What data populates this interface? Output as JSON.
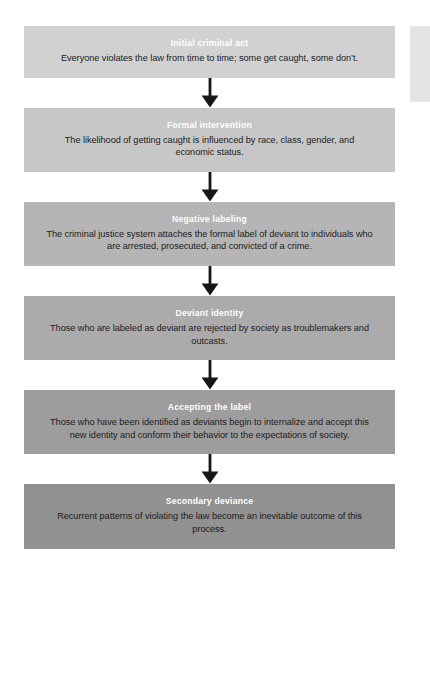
{
  "diagram": {
    "name": "labeling-theory-deviance-flowchart",
    "orientation": "vertical-top-to-bottom",
    "connector_icon": "down-arrow-icon",
    "stages": [
      {
        "title": "Initial criminal act",
        "body": "Everyone violates the law from time to time; some get caught, some don’t.",
        "fill": "#d1d1d1"
      },
      {
        "title": "Formal intervention",
        "body": "The likelihood of getting caught is influenced by race, class, gender, and economic status.",
        "fill": "#c7c7c7"
      },
      {
        "title": "Negative labeling",
        "body": "The criminal justice system attaches the formal label of deviant to individuals who are arrested, prosecuted, and convicted of a crime.",
        "fill": "#b5b5b5"
      },
      {
        "title": "Deviant identity",
        "body": "Those who are labeled as deviant are rejected by society as troublemakers and outcasts.",
        "fill": "#ababab"
      },
      {
        "title": "Accepting the label",
        "body": "Those who have been identified as deviants begin to internalize and accept this new identity and conform their behavior to the expectations of society.",
        "fill": "#9d9d9d"
      },
      {
        "title": "Secondary deviance",
        "body": "Recurrent patterns of violating the law become an inevitable outcome of this process.",
        "fill": "#919191"
      }
    ],
    "colors": {
      "title_text": "#ffffff",
      "body_text": "#1c1c1c",
      "arrow": "#161616",
      "background": "#ffffff",
      "edge_strip": "#e4e4e4"
    }
  }
}
